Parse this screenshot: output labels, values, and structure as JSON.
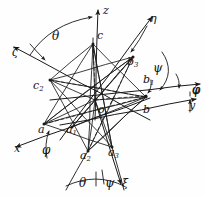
{
  "figure": {
    "style": "hand-drawn line diagram, black ink on white paper",
    "stroke_color": "#1a1a1a",
    "background_color": "#fefefe"
  },
  "axes": [
    {
      "name": "z-axis",
      "label": "z",
      "tip": [
        98,
        10
      ],
      "tail": [
        95,
        120
      ],
      "label_pos": [
        103,
        5
      ]
    },
    {
      "name": "zeta-axis",
      "label": "ζ",
      "tip": [
        14,
        47
      ],
      "tail": [
        150,
        120
      ],
      "label_pos": [
        12,
        47
      ]
    },
    {
      "name": "eta-axis",
      "label": "η",
      "tip": [
        152,
        17
      ],
      "tail": [
        60,
        140
      ],
      "label_pos": [
        150,
        13
      ]
    },
    {
      "name": "x-axis",
      "label": "x",
      "tip": [
        16,
        147
      ],
      "tail": [
        150,
        98
      ],
      "label_pos": [
        14,
        143
      ]
    },
    {
      "name": "y-axis",
      "label": "y",
      "tip": [
        196,
        99
      ],
      "tail": [
        60,
        125
      ],
      "label_pos": [
        189,
        100
      ]
    },
    {
      "name": "xi-axis",
      "label": "ξ",
      "tip": [
        121,
        184
      ],
      "tail": [
        95,
        100
      ],
      "label_pos": [
        122,
        178
      ]
    },
    {
      "name": "phi-axis",
      "label": "φ",
      "tip": [
        200,
        84
      ],
      "tail": [
        50,
        100
      ],
      "label_pos": [
        192,
        84
      ]
    }
  ],
  "angle_labels": [
    {
      "name": "theta-top",
      "text": "θ",
      "pos": [
        52,
        30
      ]
    },
    {
      "name": "psi-right",
      "text": "ψ",
      "pos": [
        153,
        62
      ]
    },
    {
      "name": "phi-right",
      "text": "φ",
      "pos": [
        192,
        84
      ]
    },
    {
      "name": "phi-left",
      "text": "φ",
      "pos": [
        42,
        144
      ]
    },
    {
      "name": "theta-bottom",
      "text": "θ",
      "pos": [
        79,
        177
      ]
    },
    {
      "name": "psi-bottom",
      "text": "ψ",
      "pos": [
        105,
        177
      ]
    }
  ],
  "vertices": [
    {
      "name": "point-c",
      "label": "c",
      "sub": "",
      "point": [
        93,
        44
      ],
      "label_pos": [
        97,
        30
      ]
    },
    {
      "name": "point-c2",
      "label": "c",
      "sub": "2",
      "point": [
        50,
        80
      ],
      "label_pos": [
        33,
        80
      ]
    },
    {
      "name": "point-b3",
      "label": "b",
      "sub": "3",
      "point": [
        133,
        57
      ],
      "label_pos": [
        127,
        56
      ]
    },
    {
      "name": "point-b1",
      "label": "b",
      "sub": "1",
      "point": [
        146,
        96
      ],
      "label_pos": [
        143,
        74
      ]
    },
    {
      "name": "point-b",
      "label": "b",
      "sub": "",
      "point": [
        146,
        97
      ],
      "label_pos": [
        143,
        104
      ]
    },
    {
      "name": "point-o",
      "label": "o",
      "sub": "",
      "point": [
        95,
        100
      ],
      "label_pos": [
        98,
        104
      ]
    },
    {
      "name": "point-a",
      "label": "a",
      "sub": "",
      "point": [
        44,
        124
      ],
      "label_pos": [
        38,
        124
      ]
    },
    {
      "name": "point-a1",
      "label": "a",
      "sub": "1",
      "point": [
        72,
        127
      ],
      "label_pos": [
        66,
        124
      ]
    },
    {
      "name": "point-a2",
      "label": "a",
      "sub": "2",
      "point": [
        88,
        151
      ],
      "label_pos": [
        80,
        150
      ]
    },
    {
      "name": "point-a3",
      "label": "a",
      "sub": "3",
      "point": [
        112,
        147
      ],
      "label_pos": [
        108,
        147
      ]
    }
  ],
  "solid_edges": [
    [
      93,
      44,
      50,
      80
    ],
    [
      93,
      44,
      146,
      97
    ],
    [
      93,
      44,
      44,
      124
    ],
    [
      93,
      44,
      112,
      147
    ],
    [
      93,
      44,
      88,
      151
    ],
    [
      50,
      80,
      146,
      97
    ],
    [
      50,
      80,
      112,
      147
    ],
    [
      50,
      80,
      88,
      151
    ],
    [
      50,
      80,
      133,
      57
    ],
    [
      133,
      57,
      44,
      124
    ],
    [
      133,
      57,
      88,
      151
    ],
    [
      133,
      57,
      72,
      127
    ],
    [
      146,
      97,
      44,
      124
    ],
    [
      146,
      97,
      72,
      127
    ],
    [
      146,
      97,
      88,
      151
    ],
    [
      44,
      124,
      112,
      147
    ],
    [
      44,
      124,
      133,
      57
    ],
    [
      112,
      147,
      93,
      44
    ],
    [
      88,
      151,
      146,
      97
    ],
    [
      95,
      100,
      93,
      44
    ],
    [
      95,
      100,
      50,
      80
    ],
    [
      95,
      100,
      146,
      97
    ],
    [
      95,
      100,
      44,
      124
    ],
    [
      95,
      100,
      112,
      147
    ],
    [
      95,
      100,
      88,
      151
    ],
    [
      95,
      100,
      133,
      57
    ],
    [
      95,
      100,
      72,
      127
    ]
  ],
  "dashed_edges": [
    [
      93,
      44,
      95,
      100
    ],
    [
      50,
      80,
      146,
      97
    ],
    [
      72,
      127,
      133,
      57
    ],
    [
      95,
      100,
      146,
      96
    ],
    [
      88,
      151,
      133,
      57
    ],
    [
      44,
      124,
      146,
      97
    ]
  ],
  "bottom_bracket": {
    "name": "bottom-angle-bracket",
    "left_ray": [
      [
        88,
        151
      ],
      [
        66,
        190
      ]
    ],
    "right_ray": [
      [
        112,
        147
      ],
      [
        124,
        190
      ]
    ],
    "arc": [
      [
        66,
        186
      ],
      [
        96,
        178
      ],
      [
        124,
        186
      ]
    ]
  }
}
